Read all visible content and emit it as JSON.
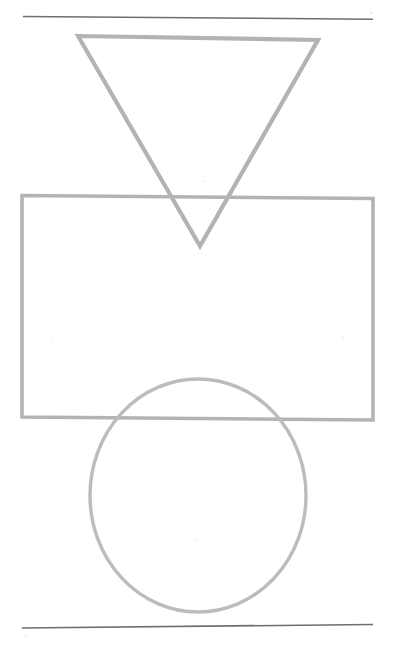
{
  "page": {
    "background_color": "#ffffff",
    "width": 397,
    "height": 652
  },
  "palette": {
    "shape_gray": "#b3b3b3",
    "shape_gray_light": "#bcbcbc",
    "rule_dark": "#6e6e6e",
    "speck_gray": "#dcdcdc",
    "background": "#ffffff"
  },
  "figure": {
    "caption": "",
    "shapes": [
      {
        "name": "top-rule",
        "kind": "line",
        "label": "Top horizontal rule",
        "color": "#6e6e6e",
        "stroke_width": 1.6,
        "points": "23,16.5 373,19.2"
      },
      {
        "name": "inverted-triangle",
        "kind": "polygon",
        "label": "Inverted triangle",
        "color": "#b3b3b3",
        "stroke_width": 4.2,
        "points": "78,36 318,40 200,246"
      },
      {
        "name": "rectangle",
        "kind": "polygon",
        "label": "Rectangle",
        "color": "#b3b3b3",
        "stroke_width": 3.6,
        "points": "22,195.5 373,198.5 373,420 22,417"
      },
      {
        "name": "circle",
        "kind": "ellipse",
        "label": "Circle",
        "color": "#bcbcbc",
        "stroke_width": 3.4,
        "cx": 198,
        "cy": 495.5,
        "rx": 108,
        "ry": 116.5
      },
      {
        "name": "bottom-rule",
        "kind": "line",
        "label": "Bottom horizontal rule",
        "color": "#6e6e6e",
        "stroke_width": 1.6,
        "points": "22,628 373,624.5"
      }
    ],
    "specks": [
      {
        "name": "speck-top-right",
        "cx": 371,
        "cy": 13,
        "r": 0.9
      },
      {
        "name": "speck-mid-upper",
        "cx": 205,
        "cy": 181,
        "r": 0.8
      },
      {
        "name": "speck-mid-right",
        "cx": 343,
        "cy": 338,
        "r": 0.8
      },
      {
        "name": "speck-left-lower",
        "cx": 53,
        "cy": 339,
        "r": 0.7
      },
      {
        "name": "speck-center-low",
        "cx": 195,
        "cy": 540,
        "r": 0.7
      },
      {
        "name": "speck-right-low",
        "cx": 382,
        "cy": 488,
        "r": 0.7
      },
      {
        "name": "speck-bottom-left",
        "cx": 26,
        "cy": 636,
        "r": 0.7
      }
    ]
  }
}
